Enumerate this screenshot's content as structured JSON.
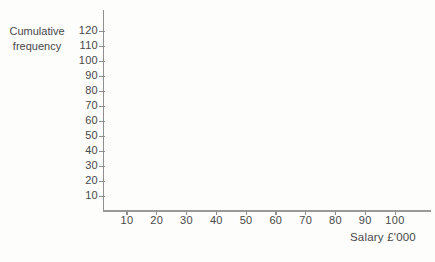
{
  "labels": {
    "y_axis_title_line1": "Cumulative",
    "y_axis_title_line2": "frequency",
    "x_axis_title": "Salary £'000"
  },
  "colors": {
    "axis_line": "#8f8f8f",
    "text": "#484848",
    "background": "#fdfdfc"
  },
  "chart_data": {
    "type": "line",
    "title": "",
    "xlabel": "Salary £'000",
    "ylabel": "Cumulative frequency",
    "x_ticks": [
      10,
      20,
      30,
      40,
      50,
      60,
      70,
      80,
      90,
      100
    ],
    "y_ticks": [
      10,
      20,
      30,
      40,
      50,
      60,
      70,
      80,
      90,
      100,
      110,
      120
    ],
    "xlim": [
      0,
      110
    ],
    "ylim": [
      0,
      133
    ],
    "grid": false,
    "legend": null,
    "series": []
  }
}
